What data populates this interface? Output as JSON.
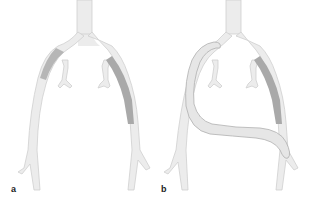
{
  "figure": {
    "panels": [
      {
        "id": "a",
        "label": "a",
        "description": "Aortoiliac bifurcation with stenotic/diseased segments shaded"
      },
      {
        "id": "b",
        "label": "b",
        "description": "Aortoiliac bifurcation with crossover bypass graft"
      }
    ],
    "colors": {
      "vessel_fill": "#ececec",
      "vessel_stroke": "#cfcfcf",
      "lesion_fill": "#a9a9a9",
      "graft_fill": "#e6e6e6",
      "graft_stroke": "#b0b0b0",
      "background": "#ffffff"
    }
  }
}
